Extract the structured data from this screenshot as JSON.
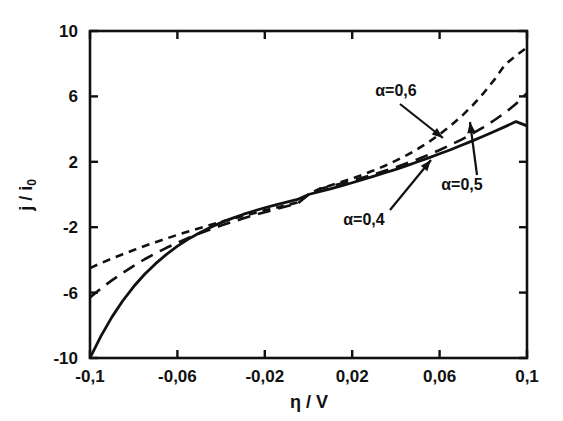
{
  "chart_data": {
    "type": "line",
    "title": "",
    "subtitle": "",
    "xlabel": "η / V",
    "ylabel": "j / i₀",
    "xlim": [
      -0.1,
      0.1
    ],
    "ylim": [
      -10,
      10
    ],
    "xticks": [
      -0.1,
      -0.06,
      -0.02,
      0.02,
      0.06,
      0.1
    ],
    "xticklabels": [
      "-0,1",
      "-0,06",
      "-0,02",
      "0,02",
      "0,06",
      "0,1"
    ],
    "yticks": [
      -10,
      -6,
      -2,
      2,
      6,
      10
    ],
    "yticklabels": [
      "-10",
      "-6",
      "-2",
      "2",
      "6",
      "10"
    ],
    "grid": false,
    "legend": "none",
    "frame": "box",
    "tick_direction": "in",
    "line_color": "#111111",
    "series": [
      {
        "name": "α=0,4",
        "label": "α=0,4",
        "style": "solid",
        "x": [
          -0.1,
          -0.095,
          -0.09,
          -0.085,
          -0.08,
          -0.075,
          -0.07,
          -0.065,
          -0.06,
          -0.055,
          -0.05,
          -0.045,
          -0.04,
          -0.035,
          -0.03,
          -0.025,
          -0.02,
          -0.015,
          -0.01,
          -0.005,
          0,
          0.005,
          0.01,
          0.015,
          0.02,
          0.025,
          0.03,
          0.035,
          0.04,
          0.045,
          0.05,
          0.055,
          0.06,
          0.065,
          0.07,
          0.075,
          0.08,
          0.085,
          0.09,
          0.095,
          0.1
        ],
        "y": [
          -10.0,
          -8.66,
          -7.5,
          -6.5,
          -5.63,
          -4.88,
          -4.23,
          -3.66,
          -3.16,
          -2.73,
          -2.35,
          -2.02,
          -1.72,
          -1.46,
          -1.22,
          -1.01,
          -0.81,
          -0.63,
          -0.46,
          -0.3,
          0.0,
          0.17,
          0.35,
          0.53,
          0.72,
          0.92,
          1.12,
          1.33,
          1.54,
          1.77,
          2.0,
          2.24,
          2.49,
          2.74,
          3.01,
          3.28,
          3.56,
          3.85,
          4.15,
          4.46,
          4.2
        ]
      },
      {
        "name": "α=0,5",
        "label": "α=0,5",
        "style": "dashed-long",
        "x": [
          -0.1,
          -0.095,
          -0.09,
          -0.085,
          -0.08,
          -0.075,
          -0.07,
          -0.065,
          -0.06,
          -0.055,
          -0.05,
          -0.045,
          -0.04,
          -0.035,
          -0.03,
          -0.025,
          -0.02,
          -0.015,
          -0.01,
          -0.005,
          0,
          0.005,
          0.01,
          0.015,
          0.02,
          0.025,
          0.03,
          0.035,
          0.04,
          0.045,
          0.05,
          0.055,
          0.06,
          0.065,
          0.07,
          0.075,
          0.08,
          0.085,
          0.09,
          0.095,
          0.1
        ],
        "y": [
          -6.3,
          -5.75,
          -5.25,
          -4.79,
          -4.36,
          -3.96,
          -3.6,
          -3.26,
          -2.95,
          -2.66,
          -2.39,
          -2.14,
          -1.9,
          -1.68,
          -1.47,
          -1.27,
          -1.08,
          -0.9,
          -0.72,
          -0.55,
          0.0,
          0.33,
          0.5,
          0.67,
          0.85,
          1.04,
          1.24,
          1.45,
          1.67,
          1.91,
          2.16,
          2.43,
          2.72,
          3.03,
          3.36,
          3.72,
          4.11,
          4.54,
          5.0,
          5.55,
          6.2
        ]
      },
      {
        "name": "α=0,6",
        "label": "α=0,6",
        "style": "dashed-short",
        "x": [
          -0.1,
          -0.095,
          -0.09,
          -0.085,
          -0.08,
          -0.075,
          -0.07,
          -0.065,
          -0.06,
          -0.055,
          -0.05,
          -0.045,
          -0.04,
          -0.035,
          -0.03,
          -0.025,
          -0.02,
          -0.015,
          -0.01,
          -0.005,
          0,
          0.005,
          0.01,
          0.015,
          0.02,
          0.025,
          0.03,
          0.035,
          0.04,
          0.045,
          0.05,
          0.055,
          0.06,
          0.065,
          0.07,
          0.075,
          0.08,
          0.085,
          0.09,
          0.095,
          0.1
        ],
        "y": [
          -4.5,
          -4.2,
          -3.92,
          -3.65,
          -3.4,
          -3.15,
          -2.92,
          -2.69,
          -2.47,
          -2.26,
          -2.06,
          -1.86,
          -1.67,
          -1.49,
          -1.31,
          -1.14,
          -0.97,
          -0.81,
          -0.65,
          -0.49,
          0.0,
          0.35,
          0.55,
          0.76,
          0.98,
          1.22,
          1.48,
          1.76,
          2.07,
          2.41,
          2.79,
          3.21,
          3.68,
          4.2,
          4.78,
          5.44,
          6.18,
          7.01,
          7.95,
          8.5,
          9.0
        ]
      }
    ],
    "annotations": [
      {
        "name": "alpha-06-annotation",
        "text": "α=0,6",
        "label_x": 396,
        "label_y": 96,
        "arrow_from_x": 400,
        "arrow_from_y": 104,
        "arrow_to_x": 443,
        "arrow_to_y": 138
      },
      {
        "name": "alpha-05-annotation",
        "text": "α=0,5",
        "label_x": 462,
        "label_y": 190,
        "arrow_from_x": 477,
        "arrow_from_y": 175,
        "arrow_to_x": 470,
        "arrow_to_y": 122
      },
      {
        "name": "alpha-04-annotation",
        "text": "α=0,4",
        "label_x": 364,
        "label_y": 225,
        "arrow_from_x": 390,
        "arrow_from_y": 210,
        "arrow_to_x": 431,
        "arrow_to_y": 160
      }
    ]
  }
}
